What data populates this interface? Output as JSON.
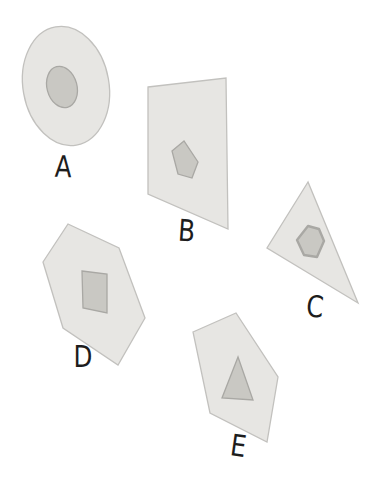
{
  "figure": {
    "background": "#ffffff",
    "outer_fill": "#e7e6e3",
    "outer_stroke": "#c2c1be",
    "inner_fill": "#c9c8c3",
    "inner_stroke": "#a9a8a4",
    "label_color": "#1d1d1d",
    "shapes": [
      {
        "label": "A",
        "outer_shape": "ellipse",
        "inner_shape": "ellipse",
        "outer": {
          "type": "ellipse",
          "cx": 66,
          "cy": 86,
          "rx": 43,
          "ry": 60,
          "rotate": -10
        },
        "inner": {
          "type": "ellipse",
          "cx": 62,
          "cy": 87,
          "rx": 15,
          "ry": 21,
          "rotate": -15
        },
        "label_pos": {
          "x": 63,
          "y": 177,
          "rotate": 2
        }
      },
      {
        "label": "B",
        "outer_shape": "quadrilateral",
        "inner_shape": "pentagon",
        "outer": {
          "type": "polygon",
          "points": [
            [
              148,
              87
            ],
            [
              226,
              78
            ],
            [
              228,
              229
            ],
            [
              148,
              194
            ]
          ]
        },
        "inner": {
          "type": "polygon",
          "points": [
            [
              184,
              141
            ],
            [
              172,
              151
            ],
            [
              178,
              174
            ],
            [
              192,
              178
            ],
            [
              198,
              162
            ]
          ]
        },
        "label_pos": {
          "x": 186,
          "y": 241,
          "rotate": 4
        }
      },
      {
        "label": "C",
        "outer_shape": "triangle",
        "inner_shape": "hexagon",
        "outer": {
          "type": "polygon",
          "points": [
            [
              308,
              182
            ],
            [
              267,
              248
            ],
            [
              358,
              303
            ]
          ]
        },
        "inner": {
          "type": "polygon",
          "points": [
            [
              308,
              226
            ],
            [
              319,
              229
            ],
            [
              324,
              241
            ],
            [
              317,
              257
            ],
            [
              304,
              255
            ],
            [
              297,
              240
            ]
          ],
          "rounded": true
        },
        "label_pos": {
          "x": 314,
          "y": 317,
          "rotate": 5
        }
      },
      {
        "label": "D",
        "outer_shape": "hexagon",
        "inner_shape": "square",
        "outer": {
          "type": "polygon",
          "points": [
            [
              68,
              224
            ],
            [
              119,
              248
            ],
            [
              145,
              318
            ],
            [
              118,
              365
            ],
            [
              63,
              328
            ],
            [
              43,
              262
            ]
          ]
        },
        "inner": {
          "type": "polygon",
          "points": [
            [
              82,
              271
            ],
            [
              107,
              274
            ],
            [
              107,
              313
            ],
            [
              83,
              308
            ]
          ]
        },
        "label_pos": {
          "x": 83,
          "y": 367,
          "rotate": 0
        }
      },
      {
        "label": "E",
        "outer_shape": "pentagon",
        "inner_shape": "triangle",
        "outer": {
          "type": "polygon",
          "points": [
            [
              193,
              332
            ],
            [
              236,
              313
            ],
            [
              278,
              377
            ],
            [
              267,
              442
            ],
            [
              210,
              413
            ]
          ]
        },
        "inner": {
          "type": "polygon",
          "points": [
            [
              238,
              357
            ],
            [
              222,
              398
            ],
            [
              253,
              400
            ]
          ]
        },
        "label_pos": {
          "x": 237,
          "y": 456,
          "rotate": 8
        }
      }
    ]
  }
}
